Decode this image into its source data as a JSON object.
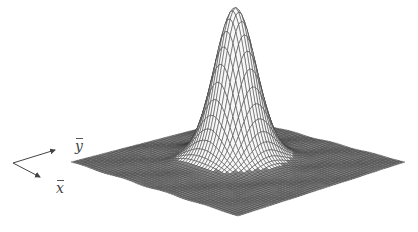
{
  "figure": {
    "axis_labels": {
      "x": "x",
      "y": "y"
    },
    "colors": {
      "mesh": "#3a3a3a",
      "background": "#ffffff",
      "peak_fill": "#f4f4f4"
    },
    "geometry": {
      "plane_corners": {
        "left": [
          71,
          162
        ],
        "bottom": [
          238,
          216
        ],
        "right": [
          405,
          162
        ],
        "back": [
          240,
          118
        ]
      },
      "peak_top": [
        250,
        22
      ],
      "axes_origin": [
        13,
        163
      ],
      "y_arrow_end": [
        55,
        150
      ],
      "x_arrow_end": [
        40,
        177
      ]
    },
    "grid": {
      "n": 60,
      "peak_sigma": 0.09,
      "peak_height": 150
    }
  }
}
